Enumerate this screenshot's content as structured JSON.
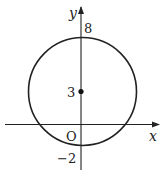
{
  "figure": {
    "type": "coordinate-plane-circle",
    "axes": {
      "x_label": "x",
      "y_label": "y",
      "origin_label": "O"
    },
    "circle": {
      "center": [
        0,
        3
      ],
      "radius": 5,
      "center_marked": true
    },
    "tick_labels": {
      "top": "8",
      "center": "3",
      "bottom": "−2"
    },
    "colors": {
      "stroke": "#222222",
      "background": "#ffffff"
    }
  }
}
